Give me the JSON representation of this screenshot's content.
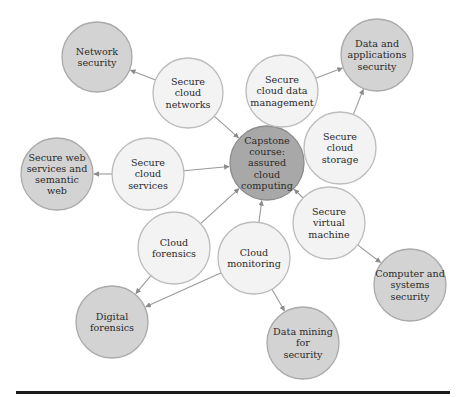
{
  "diagram": {
    "colors": {
      "center_fill": "#a8a8a8",
      "center_stroke": "#8c8c8c",
      "outcome_fill": "#d3d3d3",
      "outcome_stroke": "#a9a9a9",
      "module_fill": "#f3f3f3",
      "module_stroke": "#bcbcbc",
      "edge": "#9a9a9a",
      "text": "#2a2a2a"
    },
    "nodes": [
      {
        "id": "capstone",
        "type": "center",
        "cx": 267,
        "cy": 163,
        "r": 37,
        "lines": [
          "Capstone",
          "course:",
          "assured",
          "cloud",
          "computing"
        ]
      },
      {
        "id": "network-security",
        "type": "outcome",
        "cx": 97,
        "cy": 57,
        "r": 35,
        "lines": [
          "Network",
          "security"
        ]
      },
      {
        "id": "secure-cloud-networks",
        "type": "module",
        "cx": 188,
        "cy": 93,
        "r": 35,
        "lines": [
          "Secure",
          "cloud",
          "networks"
        ]
      },
      {
        "id": "secure-cloud-data-management",
        "type": "module",
        "cx": 282,
        "cy": 91,
        "r": 36,
        "lines": [
          "Secure",
          "cloud data",
          "management"
        ]
      },
      {
        "id": "data-applications-security",
        "type": "outcome",
        "cx": 377,
        "cy": 55,
        "r": 36,
        "lines": [
          "Data and",
          "applications",
          "security"
        ]
      },
      {
        "id": "secure-cloud-storage",
        "type": "module",
        "cx": 340,
        "cy": 148,
        "r": 36,
        "lines": [
          "Secure",
          "cloud",
          "storage"
        ]
      },
      {
        "id": "secure-web-services",
        "type": "outcome",
        "cx": 57,
        "cy": 174,
        "r": 36,
        "lines": [
          "Secure web",
          "services and",
          "semantic",
          "web"
        ]
      },
      {
        "id": "secure-cloud-services",
        "type": "module",
        "cx": 148,
        "cy": 174,
        "r": 36,
        "lines": [
          "Secure",
          "cloud",
          "services"
        ]
      },
      {
        "id": "secure-virtual-machine",
        "type": "module",
        "cx": 329,
        "cy": 223,
        "r": 36,
        "lines": [
          "Secure",
          "virtual",
          "machine"
        ]
      },
      {
        "id": "computer-systems-security",
        "type": "outcome",
        "cx": 410,
        "cy": 285,
        "r": 36,
        "lines": [
          "Computer and",
          "systems",
          "security"
        ]
      },
      {
        "id": "cloud-forensics",
        "type": "module",
        "cx": 174,
        "cy": 248,
        "r": 36,
        "lines": [
          "Cloud",
          "forensics"
        ]
      },
      {
        "id": "cloud-monitoring",
        "type": "module",
        "cx": 254,
        "cy": 258,
        "r": 36,
        "lines": [
          "Cloud",
          "monitoring"
        ]
      },
      {
        "id": "digital-forensics",
        "type": "outcome",
        "cx": 112,
        "cy": 322,
        "r": 36,
        "lines": [
          "Digital",
          "forensics"
        ]
      },
      {
        "id": "data-mining-security",
        "type": "outcome",
        "cx": 303,
        "cy": 343,
        "r": 36,
        "lines": [
          "Data mining",
          "for",
          "security"
        ]
      }
    ],
    "edges": [
      {
        "from": "secure-cloud-networks",
        "to": "network-security"
      },
      {
        "from": "secure-cloud-networks",
        "to": "capstone"
      },
      {
        "from": "secure-cloud-data-management",
        "to": "data-applications-security"
      },
      {
        "from": "secure-cloud-data-management",
        "to": "capstone"
      },
      {
        "from": "secure-cloud-storage",
        "to": "data-applications-security"
      },
      {
        "from": "secure-cloud-storage",
        "to": "capstone"
      },
      {
        "from": "secure-cloud-services",
        "to": "secure-web-services"
      },
      {
        "from": "secure-cloud-services",
        "to": "capstone"
      },
      {
        "from": "secure-virtual-machine",
        "to": "capstone"
      },
      {
        "from": "secure-virtual-machine",
        "to": "computer-systems-security"
      },
      {
        "from": "cloud-forensics",
        "to": "capstone"
      },
      {
        "from": "cloud-forensics",
        "to": "digital-forensics"
      },
      {
        "from": "cloud-monitoring",
        "to": "capstone"
      },
      {
        "from": "cloud-monitoring",
        "to": "digital-forensics"
      },
      {
        "from": "cloud-monitoring",
        "to": "data-mining-security"
      }
    ]
  }
}
